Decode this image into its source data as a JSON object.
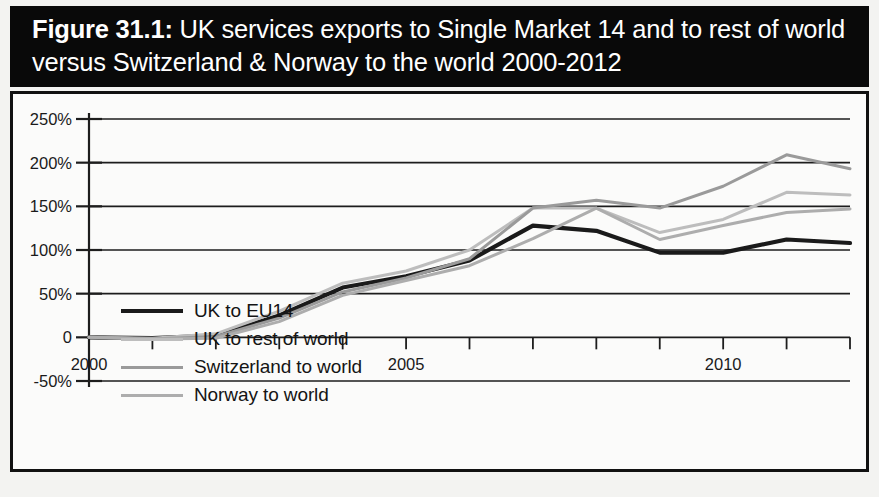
{
  "figure": {
    "number_label": "Figure 31.1:",
    "title_rest": " UK services exports to Single Market 14 and to rest of world versus Switzerland & Norway to the world 2000-2012",
    "full_title": "Figure 31.1: UK services exports to Single Market 14 and to rest of world versus Switzerland & Norway to the world 2000-2012",
    "banner_background": "#090909",
    "banner_text_color": "#ffffff",
    "frame_border_color": "#111111",
    "plot_background": "#fbfbfa"
  },
  "axes": {
    "y_tick_labels": [
      "250%",
      "200%",
      "150%",
      "100%",
      "50%",
      "0",
      "-50%"
    ],
    "y_tick_values": [
      250,
      200,
      150,
      100,
      50,
      0,
      -50
    ],
    "x_tick_labels_shown": [
      "2000",
      "2005",
      "2010"
    ],
    "x_tick_values_shown": [
      2000,
      2005,
      2010
    ],
    "x_all_ticks": [
      2000,
      2001,
      2002,
      2003,
      2004,
      2005,
      2006,
      2007,
      2008,
      2009,
      2010,
      2011,
      2012
    ],
    "gridline_color": "#1d1d1d",
    "axis_color": "#1d1d1d"
  },
  "legend": {
    "position": "inside-upper-left",
    "items": [
      {
        "label": "UK to EU14",
        "color": "#1a1a1a",
        "width": 4.2
      },
      {
        "label": "UK to rest of world",
        "color": "#bdbdbd",
        "width": 3.0
      },
      {
        "label": "Switzerland to world",
        "color": "#9a9a9a",
        "width": 3.0
      },
      {
        "label": "Norway to world",
        "color": "#adadad",
        "width": 3.0
      }
    ]
  },
  "chart_data": {
    "type": "line",
    "title": "UK services exports to Single Market 14 and to rest of world versus Switzerland & Norway to the world 2000-2012",
    "xlabel": "",
    "ylabel": "",
    "xlim": [
      2000,
      2012
    ],
    "ylim": [
      -50,
      250
    ],
    "grid": true,
    "legend_position": "inside-upper-left",
    "x": [
      2000,
      2001,
      2002,
      2003,
      2004,
      2005,
      2006,
      2007,
      2008,
      2009,
      2010,
      2011,
      2012
    ],
    "series": [
      {
        "name": "UK to EU14",
        "color": "#1a1a1a",
        "values": [
          0,
          -1,
          2,
          25,
          57,
          70,
          88,
          128,
          122,
          97,
          97,
          112,
          108
        ]
      },
      {
        "name": "UK to rest of world",
        "color": "#bdbdbd",
        "values": [
          0,
          -1,
          4,
          30,
          62,
          76,
          100,
          148,
          148,
          120,
          135,
          166,
          163
        ]
      },
      {
        "name": "Switzerland to world",
        "color": "#9a9a9a",
        "values": [
          0,
          -2,
          1,
          22,
          52,
          68,
          90,
          148,
          157,
          148,
          173,
          209,
          193
        ]
      },
      {
        "name": "Norway to world",
        "color": "#adadad",
        "values": [
          0,
          -2,
          -1,
          18,
          48,
          65,
          82,
          113,
          148,
          112,
          128,
          143,
          147
        ]
      }
    ]
  }
}
